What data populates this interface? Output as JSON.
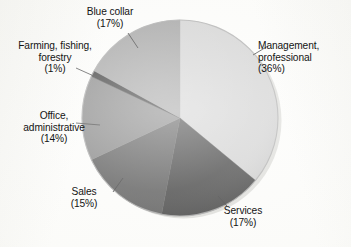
{
  "chart_data": {
    "type": "pie",
    "title": "",
    "xlabel": "",
    "ylabel": "",
    "legend": "none",
    "grid": false,
    "start_angle_deg": 0,
    "direction": "clockwise",
    "unit": "%",
    "categories": [
      "Management, professional",
      "Services",
      "Sales",
      "Office, administrative",
      "Farming, fishing, forestry",
      "Blue collar"
    ],
    "values": [
      36,
      17,
      15,
      14,
      1,
      17
    ],
    "slices": [
      {
        "name": "management",
        "label_line1": "Management,",
        "label_line2": "professional",
        "label_pct": "(36%)",
        "value": 36,
        "color": "#cacaca"
      },
      {
        "name": "services",
        "label_line1": "Services",
        "label_line2": "",
        "label_pct": "(17%)",
        "value": 17,
        "color": "#1e1e1e"
      },
      {
        "name": "sales",
        "label_line1": "Sales",
        "label_line2": "",
        "label_pct": "(15%)",
        "value": 15,
        "color": "#3a3a3a"
      },
      {
        "name": "office",
        "label_line1": "Office,",
        "label_line2": "administrative",
        "label_pct": "(14%)",
        "value": 14,
        "color": "#6b6b6b"
      },
      {
        "name": "farming",
        "label_line1": "Farming, fishing,",
        "label_line2": "forestry",
        "label_pct": "(1%)",
        "value": 1,
        "color": "#0a0a0a"
      },
      {
        "name": "bluecollar",
        "label_line1": "Blue collar",
        "label_line2": "",
        "label_pct": "(17%)",
        "value": 17,
        "color": "#8f8f8f"
      }
    ]
  },
  "colors": {
    "background": "#fcfcfa",
    "text": "#141414",
    "leader_line": "#1a1a1a",
    "pie_edge": "#9a9a9a",
    "shadow": "#b9b9b5"
  }
}
